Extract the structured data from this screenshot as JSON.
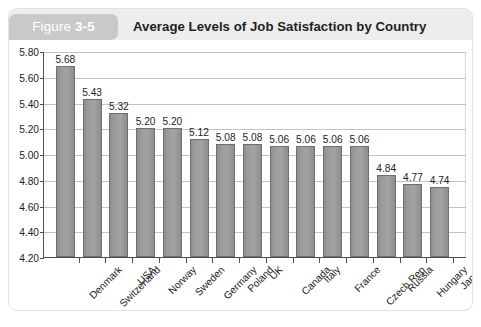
{
  "figure": {
    "label_prefix": "Figure ",
    "label_number": "3-5",
    "title": "Average Levels of Job Satisfaction by Country"
  },
  "colors": {
    "bar_fill": "#9b9b9b",
    "bar_border": "#6f6f6f",
    "header_band": "#ededed",
    "figure_tag": "#c9c9c9",
    "gridline": "#c3c3c3",
    "axis": "#4d4d4d",
    "text": "#1d1d1d"
  },
  "chart_data": {
    "type": "bar",
    "title": "Average Levels of Job Satisfaction by Country",
    "xlabel": "",
    "ylabel": "",
    "ylim": [
      4.2,
      5.8
    ],
    "ytick_step": 0.2,
    "yticks": [
      "4.20",
      "4.40",
      "4.60",
      "4.80",
      "5.00",
      "5.20",
      "5.40",
      "5.60",
      "5.80"
    ],
    "grid": true,
    "legend": false,
    "categories": [
      "Denmark",
      "Switzerland",
      "USA",
      "Norway",
      "Sweden",
      "Germany",
      "Poland",
      "UK",
      "Canada",
      "Italy",
      "France",
      "Czech Rep",
      "Russia",
      "Hungary",
      "Japan"
    ],
    "values": [
      5.68,
      5.43,
      5.32,
      5.2,
      5.2,
      5.12,
      5.08,
      5.08,
      5.06,
      5.06,
      5.06,
      5.06,
      4.84,
      4.77,
      4.74
    ],
    "value_labels": [
      "5.68",
      "5.43",
      "5.32",
      "5.20",
      "5.20",
      "5.12",
      "5.08",
      "5.08",
      "5.06",
      "5.06",
      "5.06",
      "5.06",
      "4.84",
      "4.77",
      "4.74"
    ]
  }
}
